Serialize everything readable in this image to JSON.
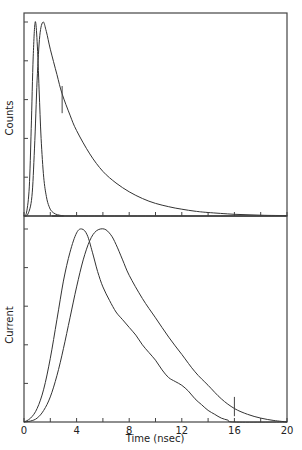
{
  "chart_data": [
    {
      "type": "line",
      "panel": "top",
      "title": "",
      "xlabel": "",
      "ylabel": "Counts",
      "xlim": [
        0,
        20
      ],
      "ylim": [
        0,
        1
      ],
      "y_ticks_count": 5,
      "x_ticks": [
        0,
        2,
        4,
        6,
        8,
        10,
        12,
        14,
        16,
        18,
        20
      ],
      "grid": false,
      "series": [
        {
          "name": "instrument response (narrow)",
          "x": [
            0,
            0.2,
            0.4,
            0.55,
            0.7,
            0.85,
            1.0,
            1.15,
            1.3,
            1.5,
            1.7,
            1.9,
            2.1,
            2.4,
            2.7,
            3.0,
            3.5,
            20
          ],
          "values": [
            0,
            0.02,
            0.15,
            0.45,
            0.82,
            1.0,
            0.9,
            0.65,
            0.4,
            0.2,
            0.1,
            0.05,
            0.025,
            0.01,
            0.004,
            0.001,
            0,
            0
          ]
        },
        {
          "name": "fluorescence decay (broad)",
          "x": [
            0,
            0.3,
            0.6,
            0.8,
            1.0,
            1.2,
            1.45,
            1.7,
            2.0,
            2.5,
            2.9,
            3.5,
            4,
            5,
            6,
            7,
            8,
            9,
            10,
            11,
            12,
            13,
            14,
            16,
            18,
            20
          ],
          "values": [
            0,
            0.01,
            0.1,
            0.35,
            0.7,
            0.93,
            1.0,
            0.95,
            0.86,
            0.73,
            0.63,
            0.52,
            0.44,
            0.32,
            0.23,
            0.17,
            0.125,
            0.09,
            0.065,
            0.048,
            0.035,
            0.025,
            0.018,
            0.009,
            0.004,
            0.002
          ]
        }
      ],
      "annotations": [
        {
          "type": "vertical-marker",
          "x": 2.9,
          "y_range": [
            0.53,
            0.67
          ]
        }
      ]
    },
    {
      "type": "line",
      "panel": "bottom",
      "title": "",
      "xlabel": "Time (nsec)",
      "ylabel": "Current",
      "xlim": [
        0,
        20
      ],
      "ylim": [
        0,
        1
      ],
      "y_ticks_count": 5,
      "x_ticks": [
        0,
        2,
        4,
        6,
        8,
        10,
        12,
        14,
        16,
        18,
        20
      ],
      "x_tick_labels": [
        "0",
        "4",
        "8",
        "12",
        "16",
        "20"
      ],
      "grid": false,
      "series": [
        {
          "name": "current A (early peak)",
          "x": [
            0,
            0.5,
            1,
            1.5,
            2,
            2.5,
            3,
            3.5,
            4,
            4.4,
            4.8,
            5.2,
            5.6,
            6,
            6.5,
            7,
            7.5,
            8,
            8.5,
            9,
            9.5,
            10,
            10.5,
            11,
            11.5,
            12,
            12.5,
            13,
            13.5,
            14,
            14.5,
            15,
            15.5,
            16,
            20
          ],
          "values": [
            0,
            0.02,
            0.07,
            0.17,
            0.33,
            0.53,
            0.73,
            0.88,
            0.98,
            1.0,
            0.97,
            0.88,
            0.78,
            0.7,
            0.63,
            0.57,
            0.53,
            0.49,
            0.45,
            0.4,
            0.36,
            0.32,
            0.27,
            0.23,
            0.21,
            0.19,
            0.16,
            0.12,
            0.09,
            0.06,
            0.04,
            0.02,
            0.01,
            0,
            0
          ]
        },
        {
          "name": "current B (late peak)",
          "x": [
            0,
            0.5,
            1,
            1.5,
            2,
            2.5,
            3,
            3.5,
            4,
            4.5,
            5,
            5.5,
            6.1,
            6.6,
            7,
            7.5,
            8,
            9,
            10,
            11,
            12,
            13,
            14,
            15,
            16,
            17,
            18,
            19,
            20
          ],
          "values": [
            0,
            0.005,
            0.02,
            0.06,
            0.13,
            0.24,
            0.38,
            0.54,
            0.7,
            0.84,
            0.94,
            0.99,
            1.0,
            0.97,
            0.92,
            0.84,
            0.76,
            0.64,
            0.54,
            0.44,
            0.35,
            0.26,
            0.19,
            0.12,
            0.07,
            0.04,
            0.02,
            0.008,
            0
          ]
        }
      ],
      "annotations": [
        {
          "type": "vertical-marker",
          "x": 16,
          "y_range": [
            0.03,
            0.13
          ]
        }
      ]
    }
  ],
  "labels": {
    "top_ylabel": "Counts",
    "bottom_ylabel": "Current",
    "xlabel": "Time (nsec)",
    "x_tick_labels": [
      "0",
      "4",
      "8",
      "12",
      "16",
      "20"
    ]
  }
}
